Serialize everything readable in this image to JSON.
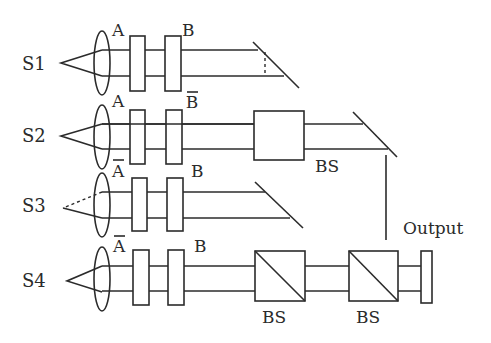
{
  "diagram": {
    "colors": {
      "stroke": "#2b2b2b",
      "background": "#ffffff"
    },
    "rows": [
      {
        "source": "S1",
        "gate_a": "A",
        "gate_a_negated": false,
        "gate_b": "B",
        "gate_b_negated": false,
        "end": "mirror"
      },
      {
        "source": "S2",
        "gate_a": "A",
        "gate_a_negated": false,
        "gate_b": "B",
        "gate_b_negated": true,
        "end": "beam-splitter + mirror",
        "bs_label": "BS"
      },
      {
        "source": "S3",
        "gate_a": "A",
        "gate_a_negated": true,
        "gate_b": "B",
        "gate_b_negated": false,
        "end": "mirror"
      },
      {
        "source": "S4",
        "gate_a": "A",
        "gate_a_negated": true,
        "gate_b": "B",
        "gate_b_negated": false,
        "end": "beam-splitters + detector",
        "bs1_label": "BS",
        "bs2_label": "BS"
      }
    ],
    "output_label": "Output"
  }
}
